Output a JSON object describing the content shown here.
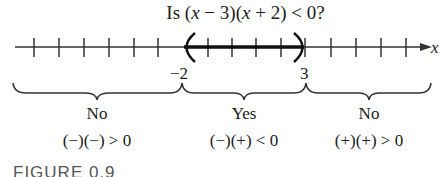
{
  "title": {
    "prefix": "Is (",
    "var1": "x",
    "mid1": " − 3)(",
    "var2": "x",
    "mid2": " + 2) < 0?"
  },
  "number_line": {
    "axis_label": "x",
    "boundary_left": "−2",
    "boundary_right": "3",
    "open_interval": [
      -2,
      3
    ]
  },
  "regions": [
    {
      "answer": "No",
      "signs": "(−)(−) > 0"
    },
    {
      "answer": "Yes",
      "signs": "(−)(+) < 0"
    },
    {
      "answer": "No",
      "signs": "(+)(+) > 0"
    }
  ],
  "caption": "FIGURE 0.9"
}
